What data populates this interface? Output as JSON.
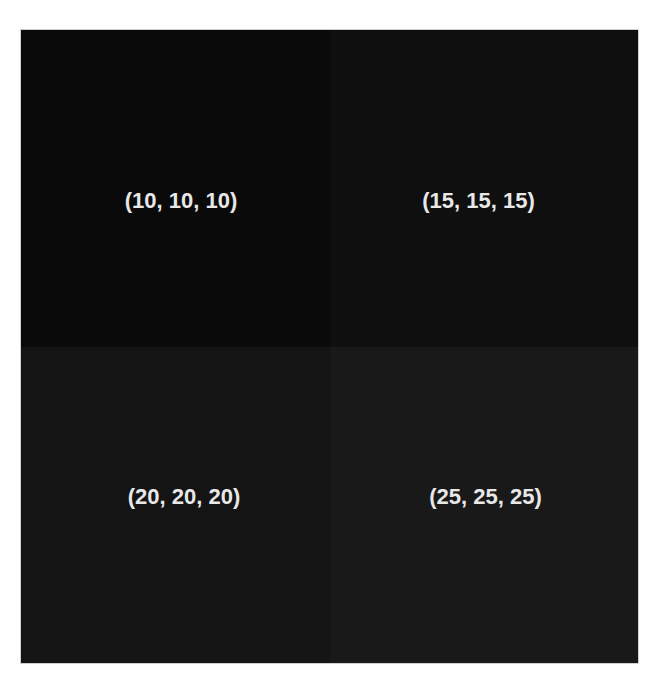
{
  "quadrants": [
    {
      "label": "(10, 10, 10)",
      "color": "#0a0a0a"
    },
    {
      "label": "(15, 15, 15)",
      "color": "#0f0f0f"
    },
    {
      "label": "(20, 20, 20)",
      "color": "#141414"
    },
    {
      "label": "(25, 25, 25)",
      "color": "#191919"
    }
  ],
  "colors": {
    "label_text": "#e8e8e8",
    "page_background": "#ffffff"
  }
}
